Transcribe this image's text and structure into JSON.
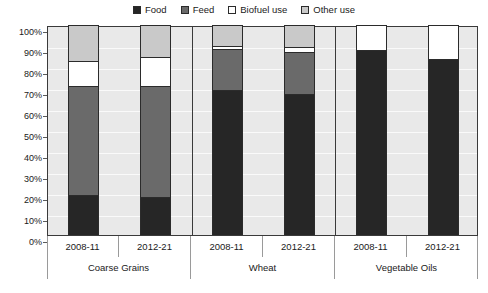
{
  "legend": {
    "position": "top-center",
    "items": [
      {
        "label": "Food",
        "color": "#262626",
        "icon": "filled-square-icon"
      },
      {
        "label": "Feed",
        "color": "#6a6a6a",
        "icon": "filled-square-icon"
      },
      {
        "label": "Biofuel use",
        "color": "#ffffff",
        "icon": "empty-square-icon"
      },
      {
        "label": "Other use",
        "color": "#c9c9c9",
        "icon": "empty-square-icon"
      }
    ]
  },
  "axes": {
    "y_ticks": [
      "0%",
      "10%",
      "20%",
      "30%",
      "40%",
      "50%",
      "60%",
      "70%",
      "80%",
      "90%",
      "100%"
    ],
    "x_periods": [
      "2008-11",
      "2012-21",
      "2008-11",
      "2012-21",
      "2008-11",
      "2012-21"
    ],
    "x_groups": [
      "Coarse Grains",
      "Wheat",
      "Vegetable Oils"
    ]
  },
  "chart_data": {
    "type": "bar",
    "title": "",
    "subtitle": "",
    "xlabel": "",
    "ylabel": "",
    "ylim": [
      0,
      100
    ],
    "stacked": true,
    "normalized_percent": true,
    "grid": true,
    "legend_position": "top-center",
    "categories": [
      "Coarse Grains 2008-11",
      "Coarse Grains 2012-21",
      "Wheat 2008-11",
      "Wheat 2012-21",
      "Vegetable Oils 2008-11",
      "Vegetable Oils 2012-21"
    ],
    "groups": [
      {
        "name": "Coarse Grains",
        "periods": [
          "2008-11",
          "2012-21"
        ]
      },
      {
        "name": "Wheat",
        "periods": [
          "2008-11",
          "2012-21"
        ]
      },
      {
        "name": "Vegetable Oils",
        "periods": [
          "2008-11",
          "2012-21"
        ]
      }
    ],
    "series": [
      {
        "name": "Food",
        "color": "#262626",
        "values": [
          19,
          18,
          69,
          67,
          88,
          84
        ]
      },
      {
        "name": "Feed",
        "color": "#6a6a6a",
        "values": [
          52,
          53,
          19.5,
          20,
          0,
          0
        ]
      },
      {
        "name": "Biofuel use",
        "color": "#ffffff",
        "values": [
          12,
          14,
          1.5,
          2.5,
          12,
          16
        ]
      },
      {
        "name": "Other use",
        "color": "#c9c9c9",
        "values": [
          17,
          15,
          10,
          10.5,
          0,
          0
        ]
      }
    ],
    "ytick_values": [
      0,
      10,
      20,
      30,
      40,
      50,
      60,
      70,
      80,
      90,
      100
    ]
  }
}
